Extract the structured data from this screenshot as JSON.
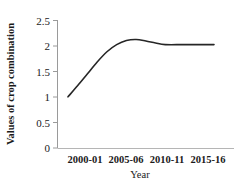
{
  "chart_data": {
    "type": "line",
    "title": "",
    "xlabel": "Year",
    "ylabel": "Values of crop combination",
    "categories": [
      "2000-01",
      "2005-06",
      "2010-11",
      "2015-16"
    ],
    "x": [
      2000,
      2005,
      2010,
      2015
    ],
    "series": [
      {
        "name": "Values of crop combination",
        "values": [
          1.0,
          2.0,
          2.0,
          2.0
        ],
        "color": "#262626",
        "detailed_points": [
          {
            "x": 2000.0,
            "y": 1.0
          },
          {
            "x": 2001.0,
            "y": 1.22
          },
          {
            "x": 2002.0,
            "y": 1.45
          },
          {
            "x": 2003.0,
            "y": 1.68
          },
          {
            "x": 2004.0,
            "y": 1.88
          },
          {
            "x": 2005.0,
            "y": 2.02
          },
          {
            "x": 2006.0,
            "y": 2.1
          },
          {
            "x": 2007.0,
            "y": 2.12
          },
          {
            "x": 2008.0,
            "y": 2.09
          },
          {
            "x": 2009.0,
            "y": 2.05
          },
          {
            "x": 2010.0,
            "y": 2.02
          },
          {
            "x": 2012.0,
            "y": 2.02
          },
          {
            "x": 2015.0,
            "y": 2.02
          }
        ]
      }
    ],
    "ylim": [
      0,
      2.5
    ],
    "yticks": [
      0,
      0.5,
      1,
      1.5,
      2,
      2.5
    ],
    "ytick_labels": [
      "0",
      "0.5",
      "1",
      "1.5",
      "2",
      "2.5"
    ],
    "grid": false,
    "legend": "none",
    "axis_color": "#808080",
    "line_color": "#262626"
  },
  "axes": {
    "y_labels": {
      "t0": "0",
      "t1": "0.5",
      "t2": "1",
      "t3": "1.5",
      "t4": "2",
      "t5": "2.5"
    },
    "x_labels": {
      "c0": "2000-01",
      "c1": "2005-06",
      "c2": "2010-11",
      "c3": "2015-16"
    },
    "x_title": "Year",
    "y_title": "Values of crop combination"
  }
}
